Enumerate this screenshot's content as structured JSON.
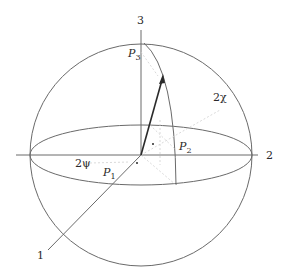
{
  "diagram": {
    "axes": {
      "axis1_label": "1",
      "axis2_label": "2",
      "axis3_label": "3"
    },
    "points": {
      "p1": {
        "base": "P",
        "sub": "1"
      },
      "p2": {
        "base": "P",
        "sub": "2"
      },
      "p3": {
        "base": "P",
        "sub": "3"
      }
    },
    "angles": {
      "psi_label": "2ψ",
      "chi_label": "2χ"
    },
    "colors": {
      "line": "#5a5a5a",
      "arrow": "#2a2a2a",
      "dashed": "#c8c8c8",
      "background": "#ffffff"
    }
  }
}
